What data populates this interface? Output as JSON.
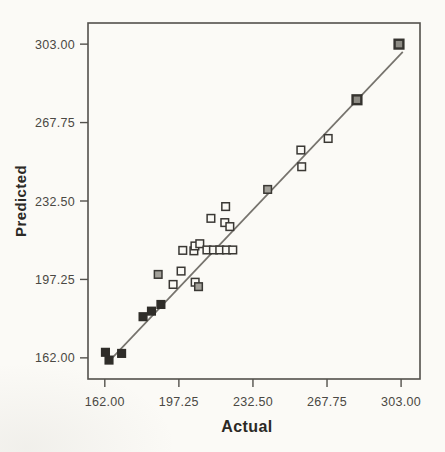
{
  "colors": {
    "paper": "#fbfaf6",
    "frame": "#53514c",
    "fit_line": "#76736d",
    "tick_text": "#4a4843",
    "title_text": "#2b2925"
  },
  "chart_data": {
    "type": "scatter",
    "title": "",
    "xlabel": "Actual",
    "ylabel": "Predicted",
    "x_ticks": [
      "162.00",
      "197.25",
      "232.50",
      "267.75",
      "303.00"
    ],
    "y_ticks": [
      "162.00",
      "197.25",
      "232.50",
      "267.75",
      "303.00"
    ],
    "x_tick_values": [
      162,
      197.25,
      232.5,
      267.75,
      303
    ],
    "y_tick_values": [
      162,
      197.25,
      232.5,
      267.75,
      303
    ],
    "xlim": [
      154,
      312
    ],
    "ylim": [
      152.5,
      312.5
    ],
    "grid": false,
    "legend": false,
    "fit_line": {
      "x1": 165.8,
      "y1": 162.2,
      "x2": 303.8,
      "y2": 299.5
    },
    "marker_styles": {
      "dark": {
        "fill": "#2f2d29",
        "stroke": "#2f2d29"
      },
      "shaded": {
        "fill": "#8d8b84",
        "stroke": "#35332f"
      },
      "gray": {
        "fill": "#a3a19a",
        "stroke": "#3a3834"
      },
      "open": {
        "fill": "#faf9f5",
        "stroke": "#3a3834"
      }
    },
    "points": [
      {
        "x": 162.3,
        "y": 164.5,
        "style": "dark"
      },
      {
        "x": 164.0,
        "y": 161.0,
        "style": "dark"
      },
      {
        "x": 170.0,
        "y": 164.0,
        "style": "dark"
      },
      {
        "x": 180.2,
        "y": 180.5,
        "style": "dark"
      },
      {
        "x": 184.2,
        "y": 183.0,
        "style": "dark"
      },
      {
        "x": 187.4,
        "y": 199.5,
        "style": "gray"
      },
      {
        "x": 188.7,
        "y": 186.0,
        "style": "dark"
      },
      {
        "x": 194.5,
        "y": 195.0,
        "style": "open"
      },
      {
        "x": 198.3,
        "y": 201.0,
        "style": "open"
      },
      {
        "x": 199.1,
        "y": 210.3,
        "style": "open"
      },
      {
        "x": 204.4,
        "y": 210.1,
        "style": "open"
      },
      {
        "x": 204.9,
        "y": 212.3,
        "style": "open"
      },
      {
        "x": 205.0,
        "y": 196.0,
        "style": "open"
      },
      {
        "x": 206.6,
        "y": 194.0,
        "style": "gray"
      },
      {
        "x": 207.2,
        "y": 213.3,
        "style": "open"
      },
      {
        "x": 210.6,
        "y": 210.5,
        "style": "open"
      },
      {
        "x": 212.5,
        "y": 224.7,
        "style": "open"
      },
      {
        "x": 213.7,
        "y": 210.5,
        "style": "open"
      },
      {
        "x": 216.7,
        "y": 210.5,
        "style": "open"
      },
      {
        "x": 219.1,
        "y": 222.8,
        "style": "open"
      },
      {
        "x": 219.5,
        "y": 230.0,
        "style": "open"
      },
      {
        "x": 219.9,
        "y": 210.5,
        "style": "open"
      },
      {
        "x": 221.5,
        "y": 221.0,
        "style": "open"
      },
      {
        "x": 222.9,
        "y": 210.5,
        "style": "open"
      },
      {
        "x": 239.5,
        "y": 237.7,
        "style": "gray"
      },
      {
        "x": 255.3,
        "y": 255.4,
        "style": "open"
      },
      {
        "x": 255.7,
        "y": 247.9,
        "style": "open"
      },
      {
        "x": 268.3,
        "y": 260.6,
        "style": "open"
      },
      {
        "x": 282.0,
        "y": 278.0,
        "style": "shaded"
      },
      {
        "x": 302.0,
        "y": 303.0,
        "style": "shaded"
      }
    ]
  }
}
